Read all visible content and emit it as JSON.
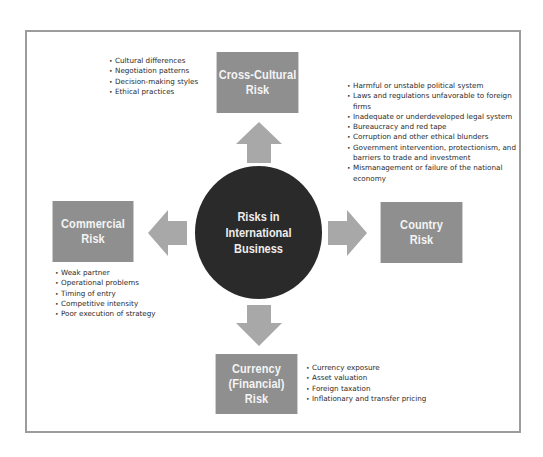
{
  "diagram": {
    "center": {
      "label": "Risks in\nInternational\nBusiness"
    },
    "risks": [
      {
        "id": "cross-cultural",
        "label": "Cross-Cultural\nRisk",
        "position": "top",
        "factors": [
          "Cultural differences",
          "Negotiation patterns",
          "Decision-making styles",
          "Ethical practices"
        ]
      },
      {
        "id": "country",
        "label": "Country\nRisk",
        "position": "right",
        "factors": [
          "Harmful or unstable political system",
          "Laws and regulations unfavorable to foreign firms",
          "Inadequate or underdeveloped legal system",
          "Bureaucracy and red tape",
          "Corruption and other ethical blunders",
          "Government intervention, protectionism, and barriers to trade and investment",
          "Mismanagement or failure of the national economy"
        ]
      },
      {
        "id": "currency",
        "label": "Currency\n(Financial) Risk",
        "position": "bottom",
        "factors": [
          "Currency exposure",
          "Asset valuation",
          "Foreign taxation",
          "Inflationary and transfer pricing"
        ]
      },
      {
        "id": "commercial",
        "label": "Commercial\nRisk",
        "position": "left",
        "factors": [
          "Weak partner",
          "Operational problems",
          "Timing of entry",
          "Competitive intensity",
          "Poor execution of strategy"
        ]
      }
    ],
    "colors": {
      "box": "#8f8f8f",
      "arrow": "#a8a8a8",
      "center": "#2a2a2a",
      "frame": "#9c9c9c"
    }
  }
}
